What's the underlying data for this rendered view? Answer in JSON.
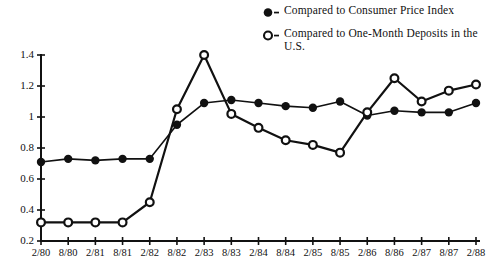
{
  "legend": {
    "position": "top-right",
    "items": [
      {
        "marker": "filled-circle-icon",
        "label": "Compared to Consumer Price Index"
      },
      {
        "marker": "open-circle-icon",
        "label": "Compared to One-Month Deposits in the U.S."
      }
    ]
  },
  "colors": {
    "ink": "#111111",
    "background": "#ffffff"
  },
  "chart_data": {
    "type": "line",
    "title": "",
    "subtitle": "",
    "xlabel": "",
    "ylabel": "",
    "grid": false,
    "legend_position": "top-right",
    "x": [
      "2/80",
      "8/80",
      "2/81",
      "8/81",
      "2/82",
      "8/82",
      "2/83",
      "8/83",
      "2/84",
      "8/84",
      "2/85",
      "8/85",
      "2/86",
      "8/86",
      "2/87",
      "8/87",
      "2/88"
    ],
    "xtick_labels": [
      "2/80",
      "8/80",
      "2/81",
      "8/81",
      "2/82",
      "8/82",
      "2/83",
      "8/83",
      "2/84",
      "8/84",
      "2/85",
      "8/85",
      "2/86",
      "8/86",
      "2/87",
      "8/87",
      "2/88"
    ],
    "ytick_labels": [
      "0.2",
      "0.4",
      "0.6",
      "0.8",
      "1",
      "1.2",
      "1.4"
    ],
    "yticks": [
      0.2,
      0.4,
      0.6,
      0.8,
      1.0,
      1.2,
      1.4
    ],
    "ylim": [
      0.2,
      1.4
    ],
    "series": [
      {
        "name": "Compared to Consumer Price Index",
        "marker": "filled-circle",
        "values": [
          0.71,
          0.73,
          0.72,
          0.73,
          0.73,
          0.95,
          1.09,
          1.11,
          1.09,
          1.07,
          1.06,
          1.1,
          1.01,
          1.04,
          1.03,
          1.03,
          1.09
        ]
      },
      {
        "name": "Compared to One-Month Deposits in the U.S.",
        "marker": "open-circle",
        "values": [
          0.32,
          0.32,
          0.32,
          0.32,
          0.45,
          1.05,
          1.4,
          1.02,
          0.93,
          0.85,
          0.82,
          0.77,
          1.03,
          1.25,
          1.1,
          1.17,
          1.21
        ]
      }
    ]
  }
}
